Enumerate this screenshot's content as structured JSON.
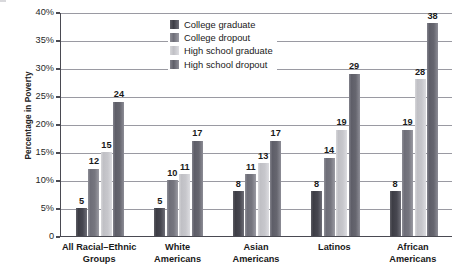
{
  "chart_data": {
    "type": "bar",
    "title": "",
    "xlabel": "",
    "ylabel": "Percentage in Poverty",
    "ylim": [
      0,
      40
    ],
    "grid": true,
    "legend_position": "top-center",
    "ytick_labels": [
      "40%",
      "35%",
      "30%",
      "25%",
      "20%",
      "15%",
      "10%",
      "5%",
      "0"
    ],
    "ytick_values": [
      40,
      35,
      30,
      25,
      20,
      15,
      10,
      5,
      0
    ],
    "categories": [
      "All Racial–Ethnic Groups",
      "White Americans",
      "Asian Americans",
      "Latinos",
      "African Americans"
    ],
    "category_lines": [
      [
        "All Racial–Ethnic",
        "Groups"
      ],
      [
        "White",
        "Americans"
      ],
      [
        "Asian",
        "Americans"
      ],
      [
        "Latinos",
        ""
      ],
      [
        "African",
        "Americans"
      ]
    ],
    "series": [
      {
        "name": "College graduate",
        "color": "#474750",
        "values": [
          5,
          5,
          8,
          8,
          8
        ]
      },
      {
        "name": "College dropout",
        "color": "#76767f",
        "values": [
          12,
          10,
          11,
          14,
          19
        ]
      },
      {
        "name": "High school graduate",
        "color": "#c7c7cc",
        "values": [
          15,
          11,
          13,
          19,
          28
        ]
      },
      {
        "name": "High school dropout",
        "color": "#66666f",
        "values": [
          24,
          17,
          17,
          29,
          38
        ]
      }
    ]
  }
}
